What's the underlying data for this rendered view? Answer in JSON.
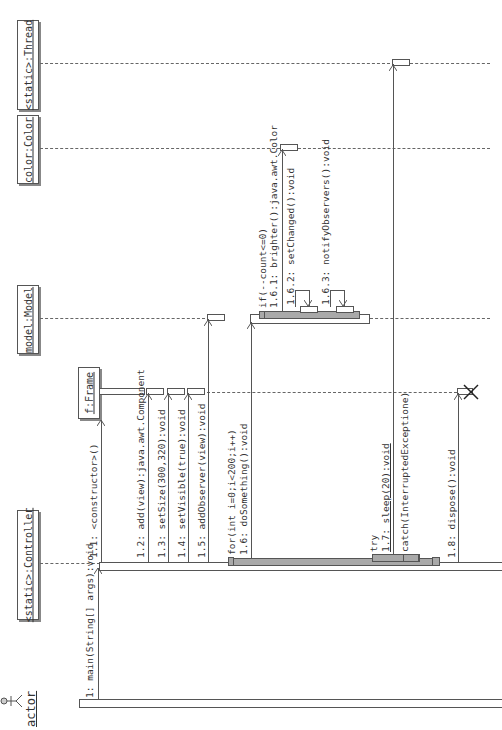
{
  "diagram": {
    "type": "UML sequence diagram (rotated 90° counter-clockwise)",
    "lifelines": [
      {
        "id": "thread",
        "label": "<static>:Thread"
      },
      {
        "id": "color",
        "label": "color:Color"
      },
      {
        "id": "model",
        "label": "model:Model"
      },
      {
        "id": "frame",
        "label": "f:Frame"
      },
      {
        "id": "controller",
        "label": "<static>:Controller"
      },
      {
        "id": "actor",
        "label": "actor"
      }
    ],
    "messages": [
      {
        "seq": "1",
        "label": "1: main(String[] args):void",
        "from": "actor",
        "to": "controller"
      },
      {
        "seq": "1.1",
        "label": "1.1: <constructor>()",
        "from": "controller",
        "to": "frame"
      },
      {
        "seq": "1.2",
        "label": "1.2: add(view):java.awt.Component",
        "from": "controller",
        "to": "frame"
      },
      {
        "seq": "1.3",
        "label": "1.3: setSize(300,320):void",
        "from": "controller",
        "to": "frame"
      },
      {
        "seq": "1.4",
        "label": "1.4: setVisible(true):void",
        "from": "controller",
        "to": "frame"
      },
      {
        "seq": "1.5",
        "label": "1.5: addObserver(view):void",
        "from": "controller",
        "to": "model"
      },
      {
        "seq": "1.6",
        "label": "1.6: doSomething():void",
        "guard": "for(int i=0;i<200;i++)",
        "from": "controller",
        "to": "model"
      },
      {
        "seq": "1.6.1",
        "label": "1.6.1: brighter():java.awt.Color",
        "guard": "if(--count<=0)",
        "from": "model",
        "to": "color"
      },
      {
        "seq": "1.6.2",
        "label": "1.6.2: setChanged():void",
        "from": "model",
        "to": "model"
      },
      {
        "seq": "1.6.3",
        "label": "1.6.3: notifyObservers():void",
        "from": "model",
        "to": "model"
      },
      {
        "seq": "1.7",
        "label": "1.7: sleep(20):void",
        "guard": "try",
        "from": "controller",
        "to": "thread"
      },
      {
        "seq": "catch",
        "label": "catch(InterruptedExceptione)"
      },
      {
        "seq": "1.8",
        "label": "1.8: dispose():void",
        "from": "controller",
        "to": "frame"
      }
    ],
    "footer_text": "actor"
  }
}
